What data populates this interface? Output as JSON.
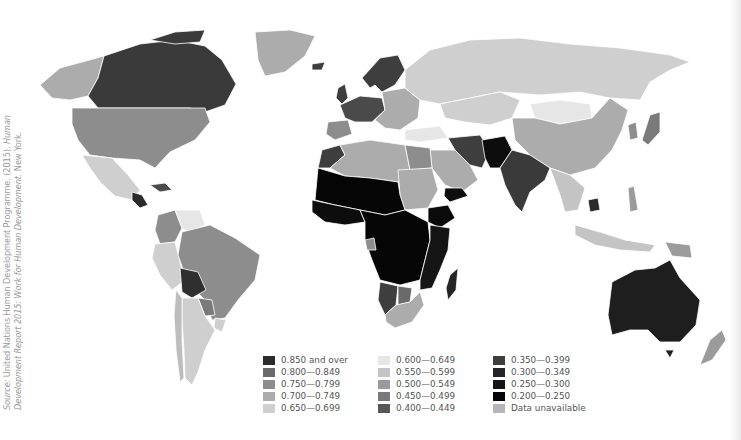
{
  "map": {
    "title": "Human Development Index world map",
    "background": "#ffffff",
    "border_color": "#ffffff"
  },
  "source": {
    "prefix": "Source:",
    "line1": " United Nations Human Development Programme. (2015). ",
    "line1_italic": "Human",
    "line2_italic": "Development Report 2015: Work for Human Development.",
    "line2": " New York."
  },
  "legend": {
    "columns": [
      [
        {
          "label": "0.850 and over",
          "color": "#2b2b2b"
        },
        {
          "label": "0.800—0.849",
          "color": "#6a6a6a"
        },
        {
          "label": "0.750—0.799",
          "color": "#8d8d8d"
        },
        {
          "label": "0.700—0.749",
          "color": "#acacac"
        },
        {
          "label": "0.650—0.699",
          "color": "#cfcfcf"
        }
      ],
      [
        {
          "label": "0.600—0.649",
          "color": "#e6e6e6"
        },
        {
          "label": "0.550—0.599",
          "color": "#c4c4c4"
        },
        {
          "label": "0.500—0.549",
          "color": "#9b9b9b"
        },
        {
          "label": "0.450—0.499",
          "color": "#7a7a7a"
        },
        {
          "label": "0.400—0.449",
          "color": "#575757"
        }
      ],
      [
        {
          "label": "0.350—0.399",
          "color": "#3e3e3e"
        },
        {
          "label": "0.300—0.349",
          "color": "#252525"
        },
        {
          "label": "0.250—0.300",
          "color": "#151515"
        },
        {
          "label": "0.200—0.250",
          "color": "#050505"
        },
        {
          "label": "Data unavailable",
          "color": "#b5b5b5"
        }
      ]
    ]
  },
  "regions": {
    "alaska": "#acacac",
    "canada": "#3a3a3a",
    "greenland": "#acacac",
    "usa": "#8d8d8d",
    "mexico": "#cfcfcf",
    "central_america": "#2b2b2b",
    "caribbean": "#4a4a4a",
    "colombia": "#8d8d8d",
    "venezuela": "#e6e6e6",
    "peru": "#cfcfcf",
    "brazil": "#8d8d8d",
    "bolivia": "#2f2f2f",
    "paraguay": "#7a7a7a",
    "argentina": "#cfcfcf",
    "chile": "#bdbdbd",
    "uruguay": "#cfcfcf",
    "iceland": "#3e3e3e",
    "scandinavia": "#3e3e3e",
    "uk": "#3e3e3e",
    "western_europe": "#4a4a4a",
    "iberia": "#8d8d8d",
    "eastern_europe": "#acacac",
    "russia": "#cfcfcf",
    "kazakhstan": "#cfcfcf",
    "mongolia": "#e6e6e6",
    "china": "#acacac",
    "turkey": "#e6e6e6",
    "iran": "#3e3e3e",
    "afghanistan_pakistan": "#0d0d0d",
    "india": "#3a3a3a",
    "se_asia": "#c4c4c4",
    "cambodia": "#2b2b2b",
    "japan": "#7a7a7a",
    "korea": "#8d8d8d",
    "indonesia": "#c4c4c4",
    "png": "#9b9b9b",
    "philippines": "#9b9b9b",
    "australia": "#1e1e1e",
    "new_zealand": "#9b9b9b",
    "north_africa": "#acacac",
    "morocco": "#3e3e3e",
    "egypt": "#8d8d8d",
    "arabia": "#acacac",
    "yemen": "#0d0d0d",
    "sahel": "#050505",
    "west_africa": "#0d0d0d",
    "central_africa": "#050505",
    "sudan": "#acacac",
    "ethiopia": "#0a0a0a",
    "east_africa": "#151515",
    "gabon": "#8d8d8d",
    "namibia": "#3e3e3e",
    "botswana": "#6a6a6a",
    "south_africa": "#acacac",
    "madagascar": "#252525"
  }
}
